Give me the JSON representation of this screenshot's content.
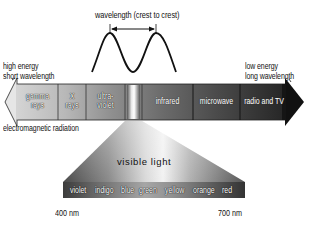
{
  "diagram": {
    "title": "electromagnetic radiation",
    "wave": {
      "label": "wavelength (crest to crest)"
    },
    "left_label": {
      "line1": "high energy",
      "line2": "short wavelength"
    },
    "right_label": {
      "line1": "low energy",
      "line2": "long wavelength"
    },
    "spectrum_segments": [
      {
        "id": "gamma",
        "line1": "gamma",
        "line2": "rays"
      },
      {
        "id": "xray",
        "line1": "X",
        "line2": "rays"
      },
      {
        "id": "uv",
        "line1": "ultra-",
        "line2": "violet"
      },
      {
        "id": "visible",
        "line1": "",
        "line2": ""
      },
      {
        "id": "infrared",
        "line1": "infrared",
        "line2": ""
      },
      {
        "id": "microwave",
        "line1": "microwave",
        "line2": ""
      },
      {
        "id": "radio",
        "line1": "radio and TV",
        "line2": ""
      }
    ],
    "visible_light": {
      "title": "visible light",
      "colors": [
        "violet",
        "indigo",
        "blue",
        "green",
        "yellow",
        "orange",
        "red"
      ],
      "min_label": "400 nm",
      "max_label": "700 nm"
    },
    "colors": {
      "arrow_dark": "#111111",
      "arrow_light": "#c8c8c8",
      "text": "#111111"
    }
  }
}
